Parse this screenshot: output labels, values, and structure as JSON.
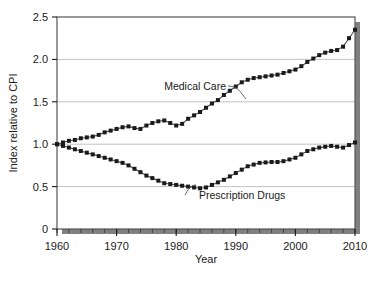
{
  "chart_data": {
    "type": "line",
    "title": "",
    "xlabel": "Year",
    "ylabel": "Index relative to CPI",
    "xlim": [
      1960,
      2010
    ],
    "ylim": [
      0,
      2.5
    ],
    "xticks": [
      1960,
      1970,
      1980,
      1990,
      2000,
      2010
    ],
    "xtick_labels": [
      "1960",
      "1970",
      "1980",
      "1990",
      "2000",
      "2010"
    ],
    "yticks": [
      0,
      0.5,
      1.0,
      1.5,
      2.0,
      2.5
    ],
    "ytick_labels": [
      "0",
      "0.5",
      "1.0",
      "1.5",
      "2.0",
      "2.5"
    ],
    "minor_xtick_interval": 2,
    "grid": "horizontal",
    "legend_position": "inline-annotations",
    "marker": "filled-square",
    "line_color": "#4d4d4d",
    "marker_color": "#1a1a1a",
    "grid_color": "#b3b3b3",
    "frame_color": "#555555",
    "shadow_color": "#7a7a7a",
    "annotations": [
      {
        "text": "Medical Care",
        "series": "Medical Care",
        "x_anchor": 1978,
        "y_anchor": 1.72
      },
      {
        "text": "Prescription Drugs",
        "series": "Prescription Drugs",
        "x_anchor": 1983,
        "y_anchor": 0.38
      }
    ],
    "x": [
      1960,
      1962,
      1964,
      1966,
      1968,
      1970,
      1972,
      1974,
      1976,
      1978,
      1980,
      1982,
      1984,
      1986,
      1988,
      1990,
      1992,
      1994,
      1996,
      1998,
      2000,
      2002,
      2004,
      2006,
      2008,
      2010
    ],
    "series": [
      {
        "name": "Medical Care",
        "values": [
          1.0,
          1.05,
          1.08,
          1.1,
          1.14,
          1.18,
          1.21,
          1.19,
          1.25,
          1.28,
          1.22,
          1.3,
          1.38,
          1.48,
          1.58,
          1.68,
          1.76,
          1.79,
          1.81,
          1.84,
          1.88,
          1.97,
          2.05,
          2.1,
          2.15,
          2.35
        ]
      },
      {
        "name": "Prescription Drugs",
        "values": [
          1.0,
          0.96,
          0.92,
          0.88,
          0.84,
          0.8,
          0.75,
          0.68,
          0.6,
          0.54,
          0.52,
          0.5,
          0.48,
          0.52,
          0.58,
          0.66,
          0.74,
          0.78,
          0.79,
          0.8,
          0.84,
          0.92,
          0.96,
          0.98,
          0.96,
          1.02
        ]
      }
    ],
    "series_detail": {
      "Medical Care": {
        "points": [
          {
            "x": 1960,
            "y": 1.0
          },
          {
            "x": 1961,
            "y": 1.02
          },
          {
            "x": 1962,
            "y": 1.04
          },
          {
            "x": 1963,
            "y": 1.05
          },
          {
            "x": 1964,
            "y": 1.07
          },
          {
            "x": 1965,
            "y": 1.08
          },
          {
            "x": 1966,
            "y": 1.09
          },
          {
            "x": 1967,
            "y": 1.11
          },
          {
            "x": 1968,
            "y": 1.14
          },
          {
            "x": 1969,
            "y": 1.16
          },
          {
            "x": 1970,
            "y": 1.18
          },
          {
            "x": 1971,
            "y": 1.2
          },
          {
            "x": 1972,
            "y": 1.21
          },
          {
            "x": 1973,
            "y": 1.19
          },
          {
            "x": 1974,
            "y": 1.18
          },
          {
            "x": 1975,
            "y": 1.22
          },
          {
            "x": 1976,
            "y": 1.25
          },
          {
            "x": 1977,
            "y": 1.27
          },
          {
            "x": 1978,
            "y": 1.28
          },
          {
            "x": 1979,
            "y": 1.25
          },
          {
            "x": 1980,
            "y": 1.22
          },
          {
            "x": 1981,
            "y": 1.24
          },
          {
            "x": 1982,
            "y": 1.3
          },
          {
            "x": 1983,
            "y": 1.34
          },
          {
            "x": 1984,
            "y": 1.38
          },
          {
            "x": 1985,
            "y": 1.43
          },
          {
            "x": 1986,
            "y": 1.48
          },
          {
            "x": 1987,
            "y": 1.52
          },
          {
            "x": 1988,
            "y": 1.58
          },
          {
            "x": 1989,
            "y": 1.63
          },
          {
            "x": 1990,
            "y": 1.68
          },
          {
            "x": 1991,
            "y": 1.73
          },
          {
            "x": 1992,
            "y": 1.76
          },
          {
            "x": 1993,
            "y": 1.78
          },
          {
            "x": 1994,
            "y": 1.79
          },
          {
            "x": 1995,
            "y": 1.8
          },
          {
            "x": 1996,
            "y": 1.81
          },
          {
            "x": 1997,
            "y": 1.82
          },
          {
            "x": 1998,
            "y": 1.84
          },
          {
            "x": 1999,
            "y": 1.86
          },
          {
            "x": 2000,
            "y": 1.88
          },
          {
            "x": 2001,
            "y": 1.92
          },
          {
            "x": 2002,
            "y": 1.97
          },
          {
            "x": 2003,
            "y": 2.01
          },
          {
            "x": 2004,
            "y": 2.05
          },
          {
            "x": 2005,
            "y": 2.08
          },
          {
            "x": 2006,
            "y": 2.1
          },
          {
            "x": 2007,
            "y": 2.11
          },
          {
            "x": 2008,
            "y": 2.15
          },
          {
            "x": 2009,
            "y": 2.25
          },
          {
            "x": 2010,
            "y": 2.35
          }
        ]
      },
      "Prescription Drugs": {
        "points": [
          {
            "x": 1960,
            "y": 1.0
          },
          {
            "x": 1961,
            "y": 0.98
          },
          {
            "x": 1962,
            "y": 0.96
          },
          {
            "x": 1963,
            "y": 0.94
          },
          {
            "x": 1964,
            "y": 0.92
          },
          {
            "x": 1965,
            "y": 0.9
          },
          {
            "x": 1966,
            "y": 0.88
          },
          {
            "x": 1967,
            "y": 0.86
          },
          {
            "x": 1968,
            "y": 0.84
          },
          {
            "x": 1969,
            "y": 0.82
          },
          {
            "x": 1970,
            "y": 0.8
          },
          {
            "x": 1971,
            "y": 0.78
          },
          {
            "x": 1972,
            "y": 0.75
          },
          {
            "x": 1973,
            "y": 0.71
          },
          {
            "x": 1974,
            "y": 0.67
          },
          {
            "x": 1975,
            "y": 0.63
          },
          {
            "x": 1976,
            "y": 0.6
          },
          {
            "x": 1977,
            "y": 0.57
          },
          {
            "x": 1978,
            "y": 0.54
          },
          {
            "x": 1979,
            "y": 0.53
          },
          {
            "x": 1980,
            "y": 0.52
          },
          {
            "x": 1981,
            "y": 0.51
          },
          {
            "x": 1982,
            "y": 0.5
          },
          {
            "x": 1983,
            "y": 0.49
          },
          {
            "x": 1984,
            "y": 0.48
          },
          {
            "x": 1985,
            "y": 0.49
          },
          {
            "x": 1986,
            "y": 0.52
          },
          {
            "x": 1987,
            "y": 0.55
          },
          {
            "x": 1988,
            "y": 0.58
          },
          {
            "x": 1989,
            "y": 0.62
          },
          {
            "x": 1990,
            "y": 0.66
          },
          {
            "x": 1991,
            "y": 0.7
          },
          {
            "x": 1992,
            "y": 0.74
          },
          {
            "x": 1993,
            "y": 0.76
          },
          {
            "x": 1994,
            "y": 0.78
          },
          {
            "x": 1995,
            "y": 0.785
          },
          {
            "x": 1996,
            "y": 0.79
          },
          {
            "x": 1997,
            "y": 0.79
          },
          {
            "x": 1998,
            "y": 0.8
          },
          {
            "x": 1999,
            "y": 0.82
          },
          {
            "x": 2000,
            "y": 0.84
          },
          {
            "x": 2001,
            "y": 0.88
          },
          {
            "x": 2002,
            "y": 0.92
          },
          {
            "x": 2003,
            "y": 0.94
          },
          {
            "x": 2004,
            "y": 0.96
          },
          {
            "x": 2005,
            "y": 0.97
          },
          {
            "x": 2006,
            "y": 0.98
          },
          {
            "x": 2007,
            "y": 0.97
          },
          {
            "x": 2008,
            "y": 0.96
          },
          {
            "x": 2009,
            "y": 0.99
          },
          {
            "x": 2010,
            "y": 1.02
          }
        ]
      }
    }
  }
}
